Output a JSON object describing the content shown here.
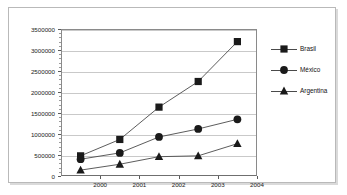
{
  "chart_data": {
    "type": "line",
    "title": "",
    "xlabel": "",
    "ylabel": "",
    "categories": [
      "2000",
      "2001",
      "2002",
      "2003",
      "2004"
    ],
    "x_tick_labels": [
      "2000",
      "2001",
      "2002",
      "2003",
      "2004"
    ],
    "y_tick_labels": [
      "0",
      "500000",
      "1000000",
      "1500000",
      "2000000",
      "2500000",
      "3000000",
      "3500000"
    ],
    "y_tick_values": [
      0,
      500000,
      1000000,
      1500000,
      2000000,
      2500000,
      3000000,
      3500000
    ],
    "ylim": [
      0,
      3500000
    ],
    "grid": true,
    "legend_position": "right",
    "series": [
      {
        "name": "Brasil",
        "marker": "square",
        "color": "#1a1a1a",
        "values": [
          480000,
          870000,
          1640000,
          2250000,
          3200000
        ]
      },
      {
        "name": "México",
        "marker": "circle",
        "color": "#1a1a1a",
        "values": [
          400000,
          550000,
          930000,
          1120000,
          1350000
        ]
      },
      {
        "name": "Argentina",
        "marker": "triangle",
        "color": "#1a1a1a",
        "values": [
          140000,
          280000,
          460000,
          480000,
          770000
        ]
      }
    ]
  },
  "legend": {
    "items": [
      {
        "label": "Brasil",
        "marker": "square"
      },
      {
        "label": "México",
        "marker": "circle"
      },
      {
        "label": "Argentina",
        "marker": "triangle"
      }
    ]
  },
  "axis": {
    "line_color": "#8a8a8a",
    "grid_color": "#c9c9c9"
  }
}
